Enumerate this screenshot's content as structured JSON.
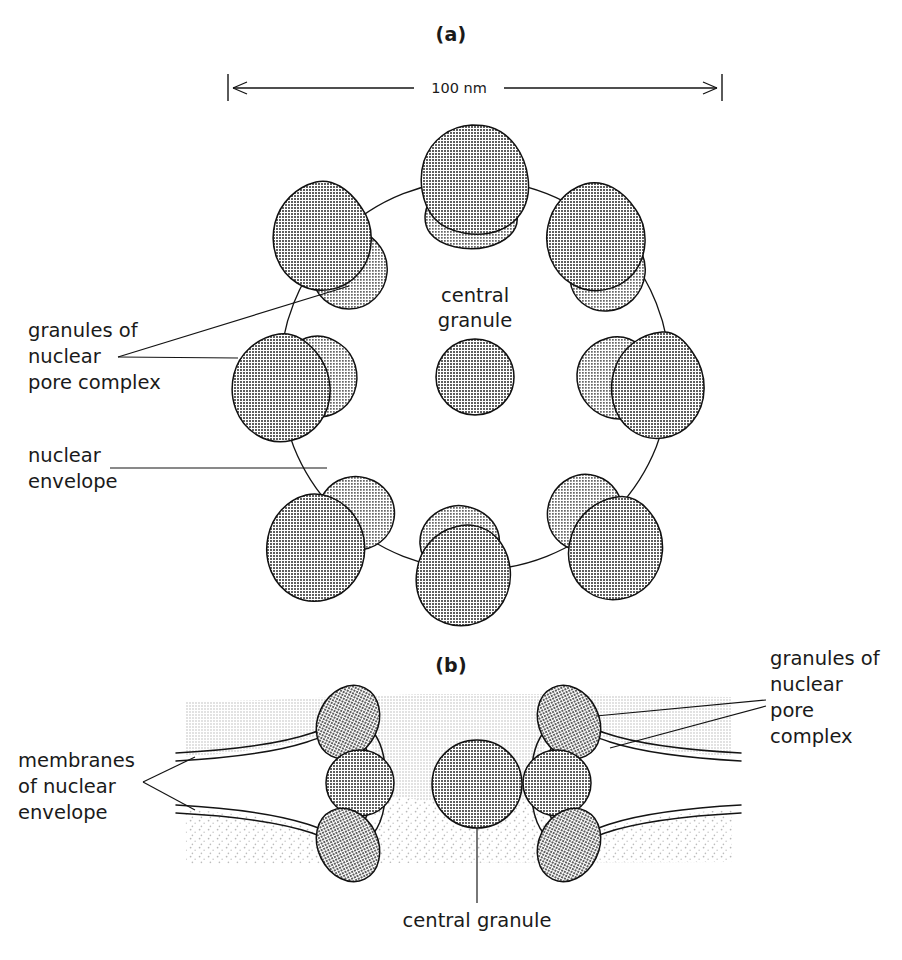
{
  "figure": {
    "background_color": "#ffffff",
    "ink_color": "#141414",
    "granule_fill": "#8d8d8d",
    "granule_fill_light": "#9a9a9a",
    "band_fill": "#e6e6e6",
    "stipple_fill": "#f2f2f2"
  },
  "panel_a": {
    "label": "(a)",
    "scale": {
      "value": "100 nm",
      "left_px": 228,
      "right_px": 722
    },
    "center_label": {
      "line1": "central",
      "line2": "granule"
    },
    "annotations": [
      {
        "id": "granules-of-npc",
        "lines": [
          "granules of",
          "nuclear",
          "pore complex"
        ]
      },
      {
        "id": "nuclear-envelope",
        "lines": [
          "nuclear",
          "envelope"
        ]
      }
    ],
    "ring": {
      "center_x": 475,
      "center_y": 375,
      "radius": 195,
      "granule_pair_count": 8
    },
    "central_granule": {
      "center_x": 475,
      "center_y": 377,
      "radius": 38
    }
  },
  "panel_b": {
    "label": "(b)",
    "annotations": [
      {
        "id": "membranes-of-nuclear-envelope",
        "lines": [
          "membranes",
          "of nuclear",
          "envelope"
        ]
      },
      {
        "id": "granules-of-npc",
        "lines": [
          "granules of",
          "nuclear",
          "pore",
          "complex"
        ]
      },
      {
        "id": "central-granule",
        "lines": [
          "central granule"
        ]
      }
    ],
    "central_granule": {
      "center_x": 477,
      "center_y": 784,
      "radius": 44
    },
    "pore_count": 2,
    "granules_per_pore": 3
  }
}
